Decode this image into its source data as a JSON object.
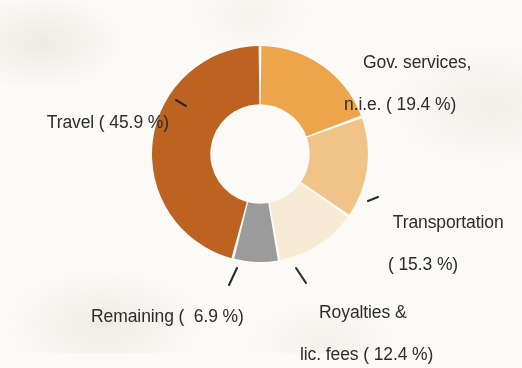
{
  "background_color": "#fbfaf7",
  "text_color": "#2c2c2c",
  "chart_data": {
    "type": "pie",
    "variant": "donut",
    "title": "",
    "subtitle": "",
    "xlabel": "",
    "ylabel": "",
    "legend_position": "none",
    "labels_inline": true,
    "grid": false,
    "units": "percent",
    "total": 99.9,
    "start_angle_deg": 0,
    "direction": "clockwise",
    "inner_radius_ratio": 0.46,
    "categories": [
      "Gov. services, n.i.e.",
      "Transportation",
      "Royalties & lic. fees",
      "Remaining",
      "Travel"
    ],
    "values": [
      19.4,
      15.3,
      12.4,
      6.9,
      45.9
    ],
    "colors": [
      "#eda54b",
      "#f0c489",
      "#f7ebd5",
      "#9b9b9b",
      "#bd6321"
    ],
    "slices": [
      {
        "name": "gov-services",
        "label_line1": "Gov. services,",
        "label_line2": "n.i.e. ( 19.4 %)",
        "value": 19.4,
        "color": "#eda54b"
      },
      {
        "name": "transportation",
        "label_line1": "Transportation",
        "label_line2": "( 15.3 %)",
        "value": 15.3,
        "color": "#f0c489"
      },
      {
        "name": "royalties-lic-fees",
        "label_line1": "Royalties &",
        "label_line2": "lic. fees ( 12.4 %)",
        "value": 12.4,
        "color": "#f7ebd5"
      },
      {
        "name": "remaining",
        "label_line1": "Remaining (  6.9 %)",
        "label_line2": "",
        "value": 6.9,
        "color": "#9b9b9b"
      },
      {
        "name": "travel",
        "label_line1": "Travel ( 45.9 %)",
        "label_line2": "",
        "value": 45.9,
        "color": "#bd6321"
      }
    ]
  }
}
